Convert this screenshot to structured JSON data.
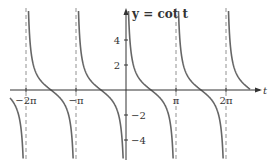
{
  "chart_data": {
    "type": "line",
    "title": "y = cot t",
    "xlabel": "t",
    "ylabel": "",
    "x_ticks": [
      "-2π",
      "-π",
      "π",
      "2π"
    ],
    "y_ticks": [
      "4",
      "2",
      "-2",
      "-4"
    ],
    "xlim": [
      -2.5,
      2.9
    ],
    "ylim": [
      -5.5,
      7
    ],
    "asymptotes": [
      "-2π",
      "-π",
      "0",
      "π",
      "2π"
    ],
    "series": [
      {
        "name": "cot t",
        "function": "cot(t)"
      }
    ],
    "grid": false,
    "colors": {
      "curve": "#666666",
      "axis": "#333333",
      "asymptote": "#777777"
    }
  }
}
